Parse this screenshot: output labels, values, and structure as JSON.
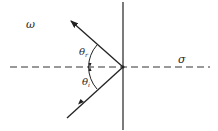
{
  "diagram": {
    "type": "reflection",
    "labels": {
      "medium_left": "ω",
      "medium_right": "σ",
      "angle_reflected": "θ",
      "angle_reflected_sub": "r",
      "angle_incident": "θ",
      "angle_incident_sub": "i"
    },
    "colors": {
      "line": "#222222",
      "background": "#ffffff"
    }
  }
}
